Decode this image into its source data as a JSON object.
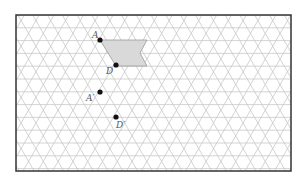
{
  "diagram": {
    "type": "triangular-grid-translation",
    "frame": {
      "x": 16,
      "y": 15,
      "width": 275,
      "height": 156,
      "stroke": "#333333"
    },
    "grid": {
      "side": 14.8,
      "row_height": 12.8,
      "origin_x": 16,
      "origin_y": 15,
      "color": "#c8c8c8"
    },
    "shape": {
      "fill": "#d9d9d9",
      "stroke": "#999999",
      "points": [
        [
          100,
          40
        ],
        [
          147,
          40
        ],
        [
          140,
          53
        ],
        [
          147,
          66
        ],
        [
          116,
          66
        ]
      ]
    },
    "points": [
      {
        "id": "A",
        "label": "A",
        "x": 100,
        "y": 40,
        "label_dx": -8,
        "label_dy": -2
      },
      {
        "id": "D",
        "label": "D",
        "x": 116,
        "y": 65,
        "label_dx": -10,
        "label_dy": 9
      },
      {
        "id": "A2",
        "label": "A′",
        "x": 100,
        "y": 92,
        "label_dx": -14,
        "label_dy": 9
      },
      {
        "id": "D2",
        "label": "D′",
        "x": 116,
        "y": 117,
        "label_dx": 0,
        "label_dy": 11
      }
    ],
    "point_color": "#111111"
  }
}
